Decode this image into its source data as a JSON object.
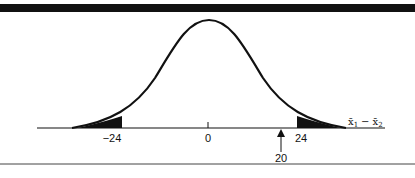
{
  "diagram": {
    "type": "normal-distribution-two-tailed",
    "axis_label": "x̄₁ − x̄₂",
    "axis_label_parts": {
      "a": "x̄",
      "a_sub": "1",
      "minus": "−",
      "b": "x̄",
      "b_sub": "2"
    },
    "ticks": [
      {
        "value": -24,
        "label": "−24"
      },
      {
        "value": 0,
        "label": "0"
      },
      {
        "value": 24,
        "label": "24"
      }
    ],
    "observed": {
      "value": 20,
      "label": "20"
    },
    "shaded_regions": [
      "left tail beyond −24",
      "right tail beyond 24"
    ],
    "colors": {
      "ink": "#111111",
      "background": "#ffffff"
    }
  }
}
